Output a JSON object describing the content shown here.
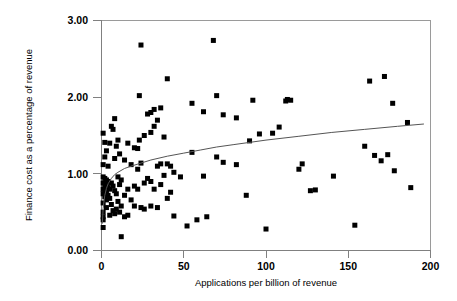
{
  "chart_data": {
    "type": "scatter",
    "title": "",
    "xlabel": "Applications per billion of revenue",
    "ylabel": "Finance cost as a percentage of revenue",
    "xlim": [
      0,
      200
    ],
    "ylim": [
      0,
      3.0
    ],
    "xticks": [
      0,
      50,
      100,
      150,
      200
    ],
    "xtick_labels": [
      "0",
      "50",
      "100",
      "150",
      "200"
    ],
    "yticks": [
      0.0,
      1.0,
      2.0,
      3.0
    ],
    "ytick_labels": [
      "0.00",
      "1.00",
      "2.00",
      "3.00"
    ],
    "grid": false,
    "legend": null,
    "marker": {
      "shape": "square",
      "color": "#000000",
      "size_px": 5
    },
    "points": [
      [
        1,
        1.53
      ],
      [
        1,
        1.12
      ],
      [
        1,
        0.96
      ],
      [
        1,
        0.88
      ],
      [
        1,
        0.8
      ],
      [
        1,
        0.74
      ],
      [
        1,
        0.62
      ],
      [
        1,
        0.5
      ],
      [
        1,
        0.44
      ],
      [
        1,
        0.4
      ],
      [
        1,
        0.3
      ],
      [
        2,
        1.41
      ],
      [
        2,
        1.22
      ],
      [
        2,
        0.94
      ],
      [
        2,
        0.86
      ],
      [
        2,
        0.78
      ],
      [
        2,
        0.7
      ],
      [
        3,
        1.3
      ],
      [
        3,
        0.92
      ],
      [
        3,
        0.84
      ],
      [
        3,
        0.76
      ],
      [
        3,
        0.66
      ],
      [
        3,
        0.56
      ],
      [
        4,
        1.1
      ],
      [
        4,
        0.9
      ],
      [
        4,
        0.82
      ],
      [
        4,
        0.72
      ],
      [
        5,
        1.4
      ],
      [
        5,
        0.8
      ],
      [
        5,
        0.68
      ],
      [
        5,
        0.46
      ],
      [
        6,
        1.62
      ],
      [
        6,
        0.88
      ],
      [
        6,
        0.6
      ],
      [
        7,
        1.58
      ],
      [
        7,
        0.84
      ],
      [
        7,
        0.52
      ],
      [
        8,
        1.72
      ],
      [
        8,
        1.2
      ],
      [
        8,
        0.78
      ],
      [
        8,
        0.48
      ],
      [
        9,
        1.36
      ],
      [
        9,
        0.74
      ],
      [
        9,
        0.54
      ],
      [
        10,
        1.44
      ],
      [
        10,
        0.96
      ],
      [
        10,
        0.64
      ],
      [
        11,
        1.26
      ],
      [
        11,
        0.86
      ],
      [
        11,
        0.5
      ],
      [
        12,
        0.92
      ],
      [
        12,
        0.58
      ],
      [
        12,
        0.18
      ],
      [
        14,
        1.18
      ],
      [
        14,
        0.72
      ],
      [
        14,
        0.44
      ],
      [
        16,
        1.4
      ],
      [
        16,
        0.8
      ],
      [
        16,
        0.46
      ],
      [
        18,
        1.12
      ],
      [
        18,
        0.66
      ],
      [
        20,
        1.34
      ],
      [
        20,
        0.84
      ],
      [
        20,
        0.58
      ],
      [
        22,
        1.33
      ],
      [
        22,
        1.06
      ],
      [
        22,
        0.8
      ],
      [
        23,
        2.02
      ],
      [
        23,
        1.44
      ],
      [
        24,
        2.68
      ],
      [
        24,
        1.14
      ],
      [
        24,
        0.56
      ],
      [
        26,
        1.5
      ],
      [
        26,
        0.88
      ],
      [
        26,
        0.54
      ],
      [
        28,
        1.78
      ],
      [
        28,
        0.94
      ],
      [
        30,
        1.8
      ],
      [
        30,
        1.54
      ],
      [
        30,
        0.9
      ],
      [
        30,
        0.58
      ],
      [
        32,
        1.84
      ],
      [
        32,
        1.62
      ],
      [
        32,
        0.8
      ],
      [
        34,
        1.7
      ],
      [
        34,
        1.1
      ],
      [
        34,
        0.56
      ],
      [
        36,
        1.86
      ],
      [
        36,
        1.13
      ],
      [
        36,
        0.86
      ],
      [
        38,
        1.48
      ],
      [
        38,
        0.98
      ],
      [
        40,
        2.24
      ],
      [
        40,
        1.13
      ],
      [
        40,
        0.68
      ],
      [
        42,
        1.1
      ],
      [
        42,
        0.76
      ],
      [
        44,
        1.02
      ],
      [
        44,
        0.45
      ],
      [
        48,
        0.96
      ],
      [
        52,
        0.32
      ],
      [
        55,
        1.92
      ],
      [
        55,
        1.28
      ],
      [
        58,
        0.4
      ],
      [
        62,
        1.81
      ],
      [
        62,
        0.97
      ],
      [
        64,
        0.44
      ],
      [
        68,
        2.74
      ],
      [
        70,
        2.02
      ],
      [
        70,
        1.22
      ],
      [
        74,
        1.77
      ],
      [
        74,
        1.15
      ],
      [
        82,
        1.73
      ],
      [
        82,
        1.12
      ],
      [
        88,
        0.72
      ],
      [
        90,
        1.43
      ],
      [
        92,
        1.96
      ],
      [
        96,
        1.52
      ],
      [
        100,
        0.28
      ],
      [
        104,
        1.53
      ],
      [
        108,
        1.61
      ],
      [
        112,
        1.95
      ],
      [
        113,
        1.97
      ],
      [
        115,
        1.96
      ],
      [
        120,
        1.06
      ],
      [
        122,
        1.13
      ],
      [
        127,
        0.78
      ],
      [
        130,
        0.79
      ],
      [
        141,
        0.97
      ],
      [
        154,
        0.33
      ],
      [
        160,
        1.36
      ],
      [
        163,
        2.21
      ],
      [
        166,
        1.24
      ],
      [
        170,
        1.17
      ],
      [
        172,
        2.27
      ],
      [
        174,
        1.25
      ],
      [
        177,
        1.92
      ],
      [
        178,
        1.04
      ],
      [
        186,
        1.67
      ],
      [
        188,
        0.82
      ]
    ],
    "trendline": {
      "type": "logarithmic",
      "label": "",
      "color": "#555555",
      "points": [
        [
          0.5,
          0.35
        ],
        [
          1,
          0.55
        ],
        [
          2,
          0.72
        ],
        [
          3,
          0.81
        ],
        [
          4,
          0.87
        ],
        [
          6,
          0.94
        ],
        [
          8,
          0.99
        ],
        [
          10,
          1.02
        ],
        [
          14,
          1.07
        ],
        [
          18,
          1.1
        ],
        [
          24,
          1.14
        ],
        [
          30,
          1.18
        ],
        [
          40,
          1.23
        ],
        [
          50,
          1.27
        ],
        [
          60,
          1.31
        ],
        [
          70,
          1.35
        ],
        [
          80,
          1.38
        ],
        [
          90,
          1.41
        ],
        [
          100,
          1.44
        ],
        [
          120,
          1.49
        ],
        [
          140,
          1.54
        ],
        [
          160,
          1.58
        ],
        [
          180,
          1.62
        ],
        [
          196,
          1.65
        ]
      ]
    }
  }
}
